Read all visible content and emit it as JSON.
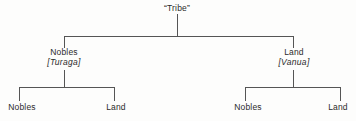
{
  "diagram": {
    "type": "hierarchy-tree",
    "title": "“Tribe”",
    "line_color": "#555555",
    "text_color": "#2b2b2b",
    "background_color": "#fdfdfc",
    "root": {
      "label": "“Tribe”"
    },
    "branches": [
      {
        "label": "Nobles",
        "alt_label": "[Turaga]",
        "children": [
          {
            "label": "Nobles"
          },
          {
            "label": "Land"
          }
        ]
      },
      {
        "label": "Land",
        "alt_label": "[Vanua]",
        "children": [
          {
            "label": "Nobles"
          },
          {
            "label": "Land"
          }
        ]
      }
    ]
  }
}
